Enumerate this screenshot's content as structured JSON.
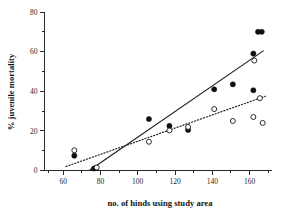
{
  "chart_data": {
    "type": "scatter",
    "title": "",
    "xlabel": "no. of hinds using study area",
    "ylabel": "% juvenile mortality",
    "xlim": [
      50,
      172
    ],
    "ylim": [
      0,
      80
    ],
    "xticks": [
      60,
      80,
      100,
      120,
      140,
      160
    ],
    "yticks": [
      0,
      20,
      40,
      60,
      80
    ],
    "xticklabels": [
      "60",
      "80",
      "100",
      "120",
      "140",
      "160"
    ],
    "yticklabels": [
      "0",
      "20",
      "40",
      "60",
      "80"
    ],
    "xminorticks": [
      70,
      90,
      110,
      130,
      150,
      170
    ],
    "yminorticks": [
      10,
      30,
      50,
      70
    ],
    "grid": false,
    "legend": "none",
    "series": [
      {
        "name": "filled circles",
        "marker": "filled-circle",
        "color": "#101010",
        "points": [
          {
            "x": 66,
            "y": 7.5
          },
          {
            "x": 76.5,
            "y": 1.0
          },
          {
            "x": 77.5,
            "y": 1.3
          },
          {
            "x": 106,
            "y": 26.0
          },
          {
            "x": 117,
            "y": 22.5
          },
          {
            "x": 127,
            "y": 20.5
          },
          {
            "x": 141,
            "y": 41.0
          },
          {
            "x": 151,
            "y": 43.5
          },
          {
            "x": 162,
            "y": 59.0
          },
          {
            "x": 162,
            "y": 40.5
          },
          {
            "x": 164.5,
            "y": 70.0
          },
          {
            "x": 166.5,
            "y": 70.0
          }
        ]
      },
      {
        "name": "open circles",
        "marker": "open-circle",
        "color": "#ffffff",
        "points": [
          {
            "x": 66,
            "y": 10.2
          },
          {
            "x": 78,
            "y": 1.5
          },
          {
            "x": 106,
            "y": 14.5
          },
          {
            "x": 117,
            "y": 20.2
          },
          {
            "x": 127,
            "y": 22.0
          },
          {
            "x": 141,
            "y": 31.0
          },
          {
            "x": 151,
            "y": 25.0
          },
          {
            "x": 162,
            "y": 27.0
          },
          {
            "x": 162.5,
            "y": 55.5
          },
          {
            "x": 165.5,
            "y": 36.5
          },
          {
            "x": 167,
            "y": 24.0
          }
        ]
      }
    ],
    "fit_lines": [
      {
        "name": "solid regression line",
        "style": "solid",
        "x_start": 74,
        "y_start": 0,
        "x_end": 167.5,
        "y_end": 60.5
      },
      {
        "name": "dotted regression line",
        "style": "dotted",
        "x_start": 61.5,
        "y_start": 2.0,
        "x_end": 168.5,
        "y_end": 37.5
      }
    ]
  }
}
